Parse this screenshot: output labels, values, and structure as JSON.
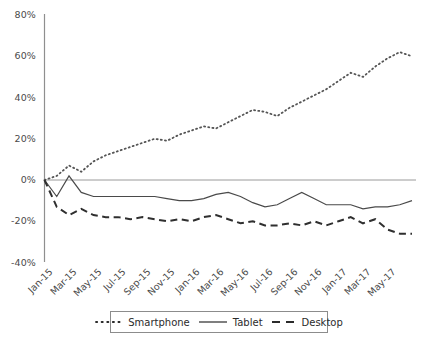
{
  "chart_data": {
    "type": "line",
    "title": "",
    "xlabel": "",
    "ylabel": "",
    "ylim": [
      -40,
      80
    ],
    "ytick_values": [
      -40,
      -20,
      0,
      20,
      40,
      60,
      80
    ],
    "ytick_labels": [
      "-40%",
      "-20%",
      "0%",
      "20%",
      "40%",
      "60%",
      "80%"
    ],
    "grid": false,
    "zero_line": true,
    "legend_position": "bottom-center",
    "x": [
      "Jan-15",
      "Feb-15",
      "Mar-15",
      "Apr-15",
      "May-15",
      "Jun-15",
      "Jul-15",
      "Aug-15",
      "Sep-15",
      "Oct-15",
      "Nov-15",
      "Dec-15",
      "Jan-16",
      "Feb-16",
      "Mar-16",
      "Apr-16",
      "May-16",
      "Jun-16",
      "Jul-16",
      "Aug-16",
      "Sep-16",
      "Oct-16",
      "Nov-16",
      "Dec-16",
      "Jan-17",
      "Feb-17",
      "Mar-17",
      "Apr-17",
      "May-17",
      "Jun-17",
      "Jul-17"
    ],
    "xtick_labels": [
      "Jan-15",
      "Mar-15",
      "May-15",
      "Jul-15",
      "Sep-15",
      "Nov-15",
      "Jan-16",
      "Mar-16",
      "May-16",
      "Jul-16",
      "Sep-16",
      "Nov-16",
      "Jan-17",
      "Mar-17",
      "May-17"
    ],
    "series": [
      {
        "name": "Smartphone",
        "style": "dotted",
        "color": "#555555",
        "values": [
          0,
          2,
          7,
          4,
          9,
          12,
          14,
          16,
          18,
          20,
          19,
          22,
          24,
          26,
          25,
          28,
          31,
          34,
          33,
          31,
          35,
          38,
          41,
          44,
          48,
          52,
          50,
          55,
          59,
          62,
          60
        ]
      },
      {
        "name": "Tablet",
        "style": "solid",
        "color": "#4a4a4a",
        "values": [
          0,
          -8,
          2,
          -6,
          -8,
          -8,
          -8,
          -8,
          -8,
          -8,
          -9,
          -10,
          -10,
          -9,
          -7,
          -6,
          -8,
          -11,
          -13,
          -12,
          -9,
          -6,
          -9,
          -12,
          -12,
          -12,
          -14,
          -13,
          -13,
          -12,
          -10
        ]
      },
      {
        "name": "Desktop",
        "style": "dashed",
        "color": "#2f2f2f",
        "values": [
          0,
          -13,
          -17,
          -14,
          -17,
          -18,
          -18,
          -19,
          -18,
          -19,
          -20,
          -19,
          -20,
          -18,
          -17,
          -19,
          -21,
          -20,
          -22,
          -22,
          -21,
          -22,
          -20,
          -22,
          -20,
          -18,
          -21,
          -19,
          -24,
          -26,
          -26
        ]
      }
    ]
  },
  "legend": {
    "items": [
      {
        "label": "Smartphone",
        "style": "dotted"
      },
      {
        "label": "Tablet",
        "style": "solid"
      },
      {
        "label": "Desktop",
        "style": "dashed"
      }
    ]
  }
}
